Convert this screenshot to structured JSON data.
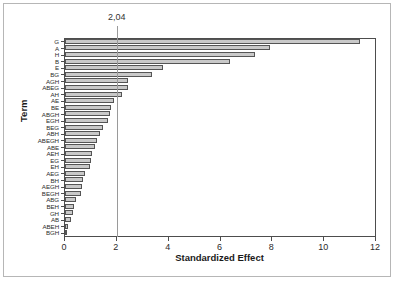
{
  "chart_data": {
    "type": "bar",
    "orientation": "horizontal",
    "title": "",
    "xlabel": "Standardized Effect",
    "ylabel": "Term",
    "xlim": [
      0,
      12
    ],
    "xticks": [
      "0",
      "2",
      "4",
      "6",
      "8",
      "10",
      "12"
    ],
    "grid": false,
    "legend": null,
    "reference_line": {
      "value": 2.04,
      "label": "2,04"
    },
    "categories": [
      "G",
      "A",
      "H",
      "B",
      "E",
      "BG",
      "AGH",
      "ABEG",
      "AH",
      "AE",
      "BE",
      "ABGH",
      "EGH",
      "BEG",
      "ABH",
      "ABEGH",
      "ABE",
      "AEH",
      "EG",
      "EH",
      "AEG",
      "BH",
      "AEGH",
      "BEGH",
      "ABG",
      "BEH",
      "GH",
      "AB",
      "ABEH",
      "BGH"
    ],
    "values": [
      11.4,
      7.9,
      7.35,
      6.35,
      3.8,
      3.35,
      2.45,
      2.42,
      2.2,
      1.9,
      1.78,
      1.72,
      1.65,
      1.45,
      1.35,
      1.22,
      1.15,
      1.05,
      1.0,
      0.98,
      0.78,
      0.68,
      0.65,
      0.6,
      0.42,
      0.35,
      0.3,
      0.22,
      0.1,
      0.05
    ],
    "colors": {
      "bar_fill": "#c9c9c9",
      "bar_edge": "#555555",
      "axis": "#4d4d4d",
      "reference_line": "#9a9a9a",
      "frame": "#b6b6b6",
      "background": "#ffffff"
    }
  }
}
